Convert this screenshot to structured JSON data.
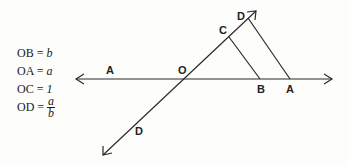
{
  "equations": [
    {
      "lhs": "OB =",
      "rhs": "b"
    },
    {
      "lhs": "OA =",
      "rhs": "a"
    },
    {
      "lhs": "OC =",
      "rhs": "1"
    },
    {
      "lhs": "OD =",
      "num": "a",
      "den": "b"
    }
  ],
  "points": {
    "A_left": "A",
    "O": "O",
    "B": "B",
    "A_right": "A",
    "C": "C",
    "D_top": "D",
    "D_bottom": "D"
  },
  "colors": {
    "line": "#2a2a2a",
    "background": "#fdfdfc"
  }
}
